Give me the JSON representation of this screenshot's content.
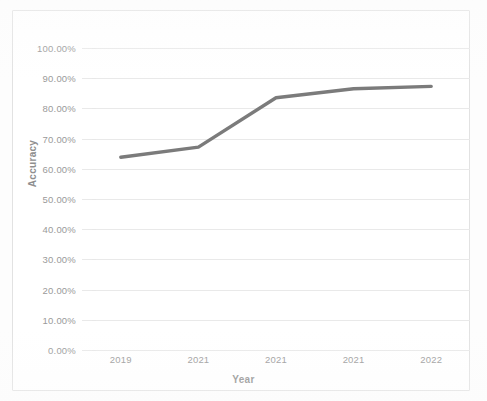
{
  "chart_data": {
    "type": "line",
    "title": "",
    "xlabel": "Year",
    "ylabel": "Accuracy",
    "categories": [
      "2019",
      "2021",
      "2021",
      "2021",
      "2022"
    ],
    "x": [
      "2019",
      "2021",
      "2021",
      "2021",
      "2022"
    ],
    "values": [
      63.8,
      67.2,
      83.5,
      86.5,
      87.3
    ],
    "series": [
      {
        "name": "Accuracy",
        "values": [
          63.8,
          67.2,
          83.5,
          86.5,
          87.3
        ]
      }
    ],
    "ylim": [
      0,
      100
    ],
    "y_ticks": [
      0,
      10,
      20,
      30,
      40,
      50,
      60,
      70,
      80,
      90,
      100
    ],
    "y_tick_labels": [
      "0.00%",
      "10.00%",
      "20.00%",
      "30.00%",
      "40.00%",
      "50.00%",
      "60.00%",
      "70.00%",
      "80.00%",
      "90.00%",
      "100.00%"
    ],
    "x_tick_labels": [
      "2019",
      "2021",
      "2021",
      "2021",
      "2022"
    ],
    "grid": "horizontal",
    "legend": "none",
    "line_color": "#7b7b7b",
    "gridline_color": "#e8e8e8",
    "text_color": "#9a9a9a",
    "background_color": "#ffffff",
    "markers": false,
    "line_width": 3
  }
}
